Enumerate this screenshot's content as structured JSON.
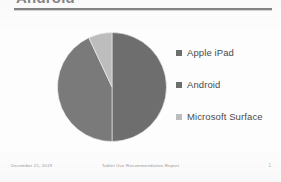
{
  "slide": {
    "title": "Android",
    "rule_color": "#7d7d7d"
  },
  "legend": {
    "items": [
      {
        "label": "Apple iPad",
        "color": "#6e6e6e",
        "icon": "square-marker-icon"
      },
      {
        "label": "Android",
        "color": "#6e6e6e",
        "icon": "square-marker-icon"
      },
      {
        "label": "Microsoft Surface",
        "color": "#bdbdbd",
        "icon": "square-marker-icon"
      }
    ]
  },
  "footer": {
    "date": "December 21, 2019",
    "center": "Tablet Use Recommendation Report",
    "page": "1"
  },
  "chart_data": {
    "type": "pie",
    "title": "Android",
    "xlabel": "",
    "ylabel": "",
    "grid": false,
    "legend_position": "right",
    "start_angle_deg": 0,
    "direction": "clockwise",
    "labels": [
      "Apple iPad",
      "Android",
      "Microsoft Surface"
    ],
    "values": [
      50,
      43,
      7
    ],
    "colors": [
      "#6e6e6e",
      "#7a7a7a",
      "#bdbdbd"
    ],
    "annotations": []
  }
}
